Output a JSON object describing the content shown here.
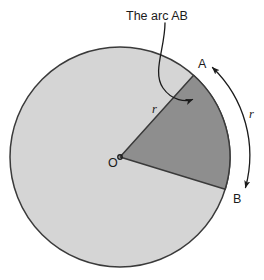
{
  "figure": {
    "title": "The arc AB",
    "caption": "The arc AB",
    "center_label": "O",
    "point_a_label": "A",
    "point_b_label": "B",
    "radius_label_inner": "r",
    "radius_label_outer": "r",
    "colors": {
      "background": "#ffffff",
      "circle_fill": "#d5d5d5",
      "sector_fill": "#8e8e8e",
      "stroke": "#3a3a3a",
      "text": "#1b1b1b"
    },
    "geometry": {
      "center_x": 120,
      "center_y": 157,
      "radius": 110,
      "point_a_angle_deg": -48,
      "point_b_angle_deg": 17
    },
    "icons": {
      "leader_arrow": "arrow-to-arc-icon",
      "span_arrow": "double-headed-arc-arrow-icon"
    }
  }
}
